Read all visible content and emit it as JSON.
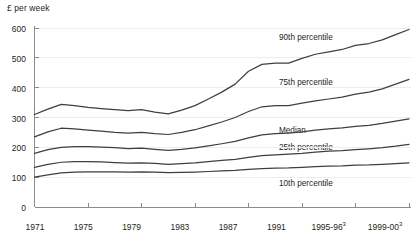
{
  "chart_data": {
    "type": "line",
    "title": "",
    "ylabel": "£ per week",
    "xlabel": "",
    "ylim": [
      0,
      600
    ],
    "grid": true,
    "legend_position": "inline-right",
    "y_ticks": [
      0,
      100,
      200,
      300,
      400,
      500,
      600
    ],
    "x_ticks": [
      "1971",
      "1975",
      "1979",
      "1983",
      "1987",
      "1991",
      "1995-96",
      "1999-00"
    ],
    "x_tick_superscripts": [
      "",
      "",
      "",
      "",
      "",
      "",
      "3",
      "3"
    ],
    "x": [
      1971,
      1972,
      1973,
      1974,
      1975,
      1976,
      1977,
      1978,
      1979,
      1980,
      1981,
      1982,
      1983,
      1984,
      1985,
      1986,
      1987,
      1988,
      1989,
      1990,
      1991,
      1992,
      1993,
      1994,
      1995,
      1996,
      1997,
      1998,
      1999
    ],
    "series": [
      {
        "name": "90th percentile",
        "values": [
          310,
          328,
          344,
          340,
          334,
          330,
          326,
          323,
          326,
          318,
          312,
          325,
          340,
          362,
          385,
          412,
          455,
          478,
          482,
          482,
          498,
          512,
          520,
          528,
          542,
          548,
          560,
          578,
          595
        ]
      },
      {
        "name": "75th percentile",
        "values": [
          235,
          252,
          264,
          262,
          258,
          254,
          250,
          248,
          250,
          246,
          243,
          250,
          259,
          272,
          285,
          300,
          320,
          336,
          340,
          340,
          348,
          356,
          362,
          368,
          378,
          385,
          396,
          412,
          428
        ]
      },
      {
        "name": "Median",
        "values": [
          180,
          192,
          200,
          202,
          202,
          201,
          199,
          196,
          197,
          193,
          190,
          193,
          198,
          205,
          212,
          220,
          232,
          242,
          246,
          248,
          252,
          258,
          262,
          265,
          270,
          274,
          280,
          288,
          295
        ]
      },
      {
        "name": "25th percentile",
        "values": [
          133,
          143,
          150,
          152,
          152,
          151,
          149,
          147,
          148,
          146,
          143,
          145,
          148,
          152,
          156,
          160,
          166,
          172,
          175,
          177,
          180,
          184,
          187,
          189,
          192,
          195,
          199,
          204,
          210
        ]
      },
      {
        "name": "10th percentile",
        "values": [
          100,
          108,
          114,
          117,
          118,
          118,
          118,
          117,
          118,
          117,
          115,
          116,
          117,
          119,
          121,
          123,
          126,
          129,
          130,
          131,
          133,
          135,
          137,
          138,
          140,
          141,
          143,
          145,
          148
        ]
      }
    ],
    "series_labels": [
      {
        "text": "90th percentile",
        "x": 279,
        "y": 38
      },
      {
        "text": "75th percentile",
        "x": 279,
        "y": 83
      },
      {
        "text": "Median",
        "x": 279,
        "y": 131
      },
      {
        "text": "25th percentile",
        "x": 279,
        "y": 148
      },
      {
        "text": "10th percentile",
        "x": 279,
        "y": 184
      }
    ],
    "colors": {
      "line": "#3f3f3f",
      "axis": "#8c8c8c",
      "grid": "#ededed",
      "text": "#231f20",
      "background": "#ffffff"
    }
  }
}
